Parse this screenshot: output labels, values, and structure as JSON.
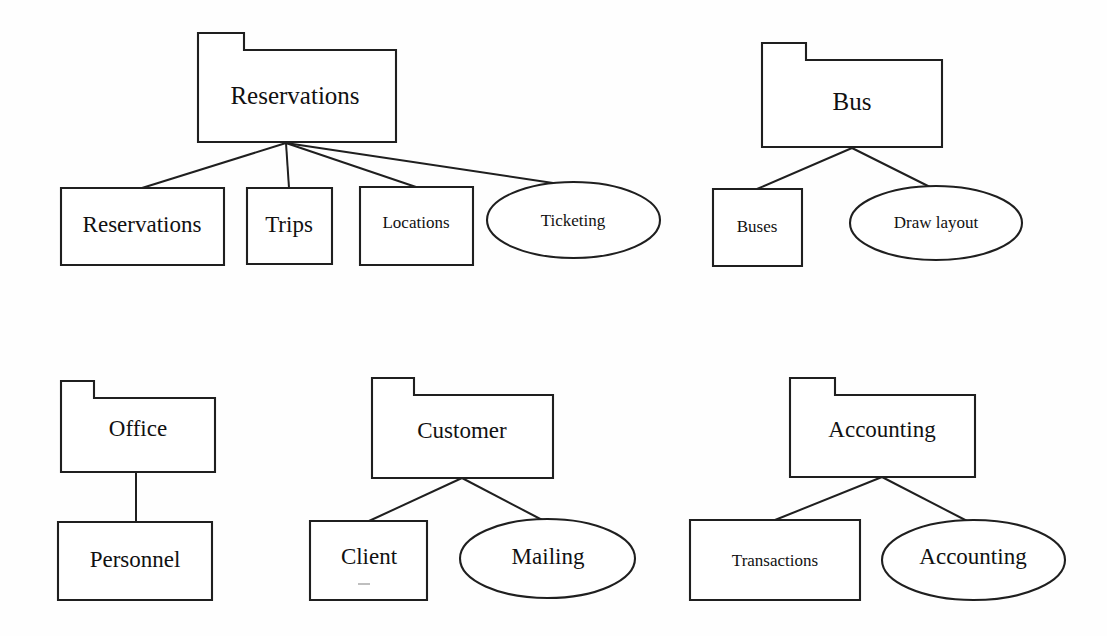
{
  "diagram": {
    "type": "uml-package-diagram",
    "background_color": "#fefefe",
    "line_color": "#1f1f1f",
    "groups": [
      {
        "id": "reservations-group",
        "package": {
          "name": "Reservations",
          "shape": "package",
          "x": 198,
          "y": 33,
          "w": 198,
          "h": 109,
          "tab_w": 46,
          "tab_h": 17,
          "label_size": "label-xl",
          "label_cx": 295,
          "label_cy": 98
        },
        "children": [
          {
            "name": "Reservations",
            "shape": "rect",
            "x": 61,
            "y": 188,
            "w": 163,
            "h": 77,
            "label_size": "label-lg",
            "label_cx": 142,
            "label_cy": 227
          },
          {
            "name": "Trips",
            "shape": "rect",
            "x": 247,
            "y": 188,
            "w": 85,
            "h": 76,
            "label_size": "label-lg",
            "label_cx": 289,
            "label_cy": 227
          },
          {
            "name": "Locations",
            "shape": "rect",
            "x": 360,
            "y": 187,
            "w": 113,
            "h": 78,
            "label_size": "label-sm",
            "label_cx": 416,
            "label_cy": 224
          },
          {
            "name": "Ticketing",
            "shape": "ellipse",
            "x": 487,
            "y": 182,
            "w": 173,
            "h": 76,
            "label_size": "label-sm",
            "label_cx": 573,
            "label_cy": 222
          }
        ],
        "hub": {
          "x": 286,
          "y": 143
        },
        "connector_targets": [
          {
            "x": 142,
            "y": 188
          },
          {
            "x": 289,
            "y": 188
          },
          {
            "x": 416,
            "y": 187
          },
          {
            "x": 573,
            "y": 186
          }
        ]
      },
      {
        "id": "bus-group",
        "package": {
          "name": "Bus",
          "shape": "package",
          "x": 762,
          "y": 43,
          "w": 180,
          "h": 104,
          "tab_w": 44,
          "tab_h": 17,
          "label_size": "label-xl",
          "label_cx": 852,
          "label_cy": 104
        },
        "children": [
          {
            "name": "Buses",
            "shape": "rect",
            "x": 713,
            "y": 189,
            "w": 89,
            "h": 77,
            "label_size": "label-sm",
            "label_cx": 757,
            "label_cy": 228
          },
          {
            "name": "Draw layout",
            "shape": "ellipse",
            "x": 850,
            "y": 186,
            "w": 172,
            "h": 74,
            "label_size": "label-sm",
            "label_cx": 936,
            "label_cy": 224
          }
        ],
        "hub": {
          "x": 852,
          "y": 148
        },
        "connector_targets": [
          {
            "x": 757,
            "y": 189
          },
          {
            "x": 936,
            "y": 190
          }
        ]
      },
      {
        "id": "office-group",
        "package": {
          "name": "Office",
          "shape": "package",
          "x": 61,
          "y": 381,
          "w": 154,
          "h": 91,
          "tab_w": 33,
          "tab_h": 17,
          "label_size": "label-lg",
          "label_cx": 138,
          "label_cy": 431
        },
        "children": [
          {
            "name": "Personnel",
            "shape": "rect",
            "x": 58,
            "y": 522,
            "w": 154,
            "h": 78,
            "label_size": "label-lg",
            "label_cx": 135,
            "label_cy": 562
          }
        ],
        "hub": {
          "x": 136,
          "y": 472
        },
        "connector_targets": [
          {
            "x": 136,
            "y": 522
          }
        ]
      },
      {
        "id": "customer-group",
        "package": {
          "name": "Customer",
          "shape": "package",
          "x": 372,
          "y": 378,
          "w": 181,
          "h": 100,
          "tab_w": 42,
          "tab_h": 17,
          "label_size": "label-lg",
          "label_cx": 462,
          "label_cy": 433
        },
        "children": [
          {
            "name": "Client",
            "shape": "rect",
            "x": 310,
            "y": 521,
            "w": 117,
            "h": 79,
            "label_size": "label-lg",
            "label_cx": 369,
            "label_cy": 559
          },
          {
            "name": "Mailing",
            "shape": "ellipse",
            "x": 460,
            "y": 519,
            "w": 175,
            "h": 79,
            "label_size": "label-lg",
            "label_cx": 548,
            "label_cy": 559
          }
        ],
        "hub": {
          "x": 462,
          "y": 478
        },
        "connector_targets": [
          {
            "x": 369,
            "y": 521
          },
          {
            "x": 548,
            "y": 523
          }
        ]
      },
      {
        "id": "accounting-group",
        "package": {
          "name": "Accounting",
          "shape": "package",
          "x": 790,
          "y": 378,
          "w": 185,
          "h": 99,
          "tab_w": 45,
          "tab_h": 17,
          "label_size": "label-lg",
          "label_cx": 882,
          "label_cy": 432
        },
        "children": [
          {
            "name": "Transactions",
            "shape": "rect",
            "x": 690,
            "y": 520,
            "w": 170,
            "h": 80,
            "label_size": "label-sm",
            "label_cx": 775,
            "label_cy": 562
          },
          {
            "name": "Accounting",
            "shape": "ellipse",
            "x": 882,
            "y": 520,
            "w": 183,
            "h": 80,
            "label_size": "label-lg",
            "label_cx": 973,
            "label_cy": 559
          }
        ],
        "hub": {
          "x": 882,
          "y": 477
        },
        "connector_targets": [
          {
            "x": 775,
            "y": 520
          },
          {
            "x": 973,
            "y": 524
          }
        ]
      }
    ],
    "artifacts": [
      {
        "id": "client-smudge",
        "x1": 358,
        "y1": 584,
        "x2": 370,
        "y2": 584
      }
    ]
  }
}
